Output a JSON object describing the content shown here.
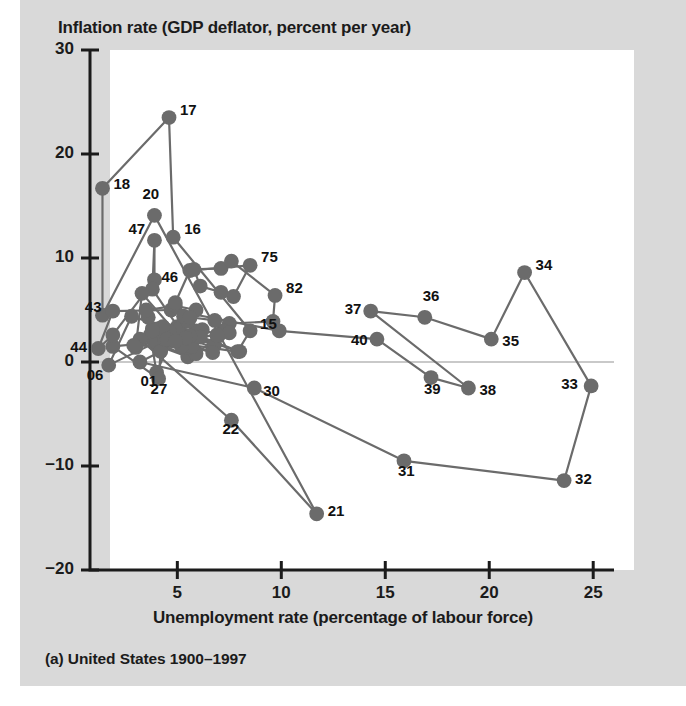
{
  "figure": {
    "caption": "(a) United States 1900–1997",
    "title": "Inflation rate (GDP deflator, percent per year)",
    "xaxis_title": "Unemployment rate (percentage of labour force)",
    "background_color": "#d9d9d9",
    "plot_background_color": "#ffffff",
    "marker_color": "#6b6b6b",
    "line_color": "#6b6b6b",
    "axis_color": "#1b1b1b"
  },
  "chart_data": {
    "type": "scatter",
    "title": "Inflation rate (GDP deflator, percent per year)",
    "subtitle": "(a) United States 1900–1997",
    "xlabel": "Unemployment rate (percentage of labour force)",
    "ylabel": "Inflation rate (GDP deflator, percent per year)",
    "xlim": [
      0.8,
      26.0
    ],
    "ylim": [
      -20,
      30
    ],
    "xticks": [
      5,
      10,
      15,
      20,
      25
    ],
    "yticks": [
      30,
      20,
      10,
      0,
      -10,
      -20
    ],
    "grid": false,
    "legend": null,
    "connected": true,
    "zero_line": true,
    "annotations": [
      "17",
      "18",
      "20",
      "47",
      "16",
      "36",
      "75",
      "82",
      "46",
      "43",
      "15",
      "44",
      "37",
      "36",
      "40",
      "34",
      "35",
      "39",
      "38",
      "33",
      "06",
      "01",
      "27",
      "36",
      "30",
      "22",
      "31",
      "32",
      "21"
    ],
    "series": [
      {
        "name": "United States 1900-1997",
        "points": [
          {
            "label": "00",
            "x": 5.0,
            "y": 3.4,
            "show_label": false
          },
          {
            "label": "01",
            "x": 4.0,
            "y": -1.0,
            "show_label": true,
            "lx": -16,
            "ly": 8
          },
          {
            "label": "02",
            "x": 3.7,
            "y": 2.6,
            "show_label": false
          },
          {
            "label": "03",
            "x": 3.9,
            "y": 1.8,
            "show_label": false
          },
          {
            "label": "04",
            "x": 5.4,
            "y": 1.2,
            "show_label": false
          },
          {
            "label": "05",
            "x": 4.3,
            "y": 2.2,
            "show_label": false
          },
          {
            "label": "06",
            "x": 1.7,
            "y": -0.3,
            "show_label": true,
            "lx": -22,
            "ly": 9
          },
          {
            "label": "07",
            "x": 2.8,
            "y": 4.4,
            "show_label": false
          },
          {
            "label": "08",
            "x": 8.0,
            "y": 1.0,
            "show_label": false
          },
          {
            "label": "09",
            "x": 5.1,
            "y": 3.2,
            "show_label": false
          },
          {
            "label": "10",
            "x": 5.9,
            "y": 3.0,
            "show_label": false
          },
          {
            "label": "11",
            "x": 6.7,
            "y": 1.4,
            "show_label": false
          },
          {
            "label": "12",
            "x": 4.6,
            "y": 3.0,
            "show_label": false
          },
          {
            "label": "13",
            "x": 4.3,
            "y": 2.0,
            "show_label": false
          },
          {
            "label": "14",
            "x": 7.9,
            "y": 1.0,
            "show_label": false
          },
          {
            "label": "15",
            "x": 8.5,
            "y": 3.0,
            "show_label": true,
            "lx": 10,
            "ly": -8
          },
          {
            "label": "16",
            "x": 4.8,
            "y": 12.0,
            "show_label": true,
            "lx": 11,
            "ly": -9
          },
          {
            "label": "17",
            "x": 4.6,
            "y": 23.5,
            "show_label": true,
            "lx": 11,
            "ly": -9
          },
          {
            "label": "18",
            "x": 1.4,
            "y": 16.7,
            "show_label": true,
            "lx": 11,
            "ly": -5
          },
          {
            "label": "19",
            "x": 1.4,
            "y": 4.5,
            "show_label": false
          },
          {
            "label": "20",
            "x": 3.9,
            "y": 14.1,
            "show_label": true,
            "lx": -12,
            "ly": -22
          },
          {
            "label": "21",
            "x": 11.7,
            "y": -14.6,
            "show_label": true,
            "lx": 11,
            "ly": -4
          },
          {
            "label": "22",
            "x": 7.6,
            "y": -5.6,
            "show_label": true,
            "lx": -9,
            "ly": 8
          },
          {
            "label": "23",
            "x": 3.2,
            "y": 2.2,
            "show_label": false
          },
          {
            "label": "24",
            "x": 5.5,
            "y": 0.5,
            "show_label": false
          },
          {
            "label": "25",
            "x": 4.0,
            "y": 1.9,
            "show_label": false
          },
          {
            "label": "26",
            "x": 1.9,
            "y": 1.5,
            "show_label": false
          },
          {
            "label": "27",
            "x": 4.1,
            "y": -1.6,
            "show_label": true,
            "lx": -8,
            "ly": 9
          },
          {
            "label": "28",
            "x": 4.2,
            "y": 1.0,
            "show_label": false
          },
          {
            "label": "29",
            "x": 3.2,
            "y": 0.0,
            "show_label": false
          },
          {
            "label": "30",
            "x": 8.7,
            "y": -2.5,
            "show_label": true,
            "lx": 9,
            "ly": 2
          },
          {
            "label": "31",
            "x": 15.9,
            "y": -9.5,
            "show_label": true,
            "lx": -6,
            "ly": 9
          },
          {
            "label": "32",
            "x": 23.6,
            "y": -11.4,
            "show_label": true,
            "lx": 11,
            "ly": -3
          },
          {
            "label": "33",
            "x": 24.9,
            "y": -2.3,
            "show_label": true,
            "lx": -30,
            "ly": -3
          },
          {
            "label": "34",
            "x": 21.7,
            "y": 8.6,
            "show_label": true,
            "lx": 11,
            "ly": -9
          },
          {
            "label": "35",
            "x": 20.1,
            "y": 2.2,
            "show_label": true,
            "lx": 11,
            "ly": 1
          },
          {
            "label": "36",
            "x": 16.9,
            "y": 4.3,
            "show_label": true,
            "lx": -2,
            "ly": -22
          },
          {
            "label": "37",
            "x": 14.3,
            "y": 4.9,
            "show_label": true,
            "lx": -26,
            "ly": -3
          },
          {
            "label": "38",
            "x": 19.0,
            "y": -2.5,
            "show_label": true,
            "lx": 11,
            "ly": 1
          },
          {
            "label": "39",
            "x": 17.2,
            "y": -1.5,
            "show_label": true,
            "lx": -7,
            "ly": 10
          },
          {
            "label": "40",
            "x": 14.6,
            "y": 2.2,
            "show_label": true,
            "lx": -26,
            "ly": 0
          },
          {
            "label": "41",
            "x": 9.9,
            "y": 3.0,
            "show_label": false
          },
          {
            "label": "42",
            "x": 4.7,
            "y": 5.0,
            "show_label": false
          },
          {
            "label": "43",
            "x": 1.9,
            "y": 4.9,
            "show_label": true,
            "lx": -28,
            "ly": -5
          },
          {
            "label": "44",
            "x": 1.2,
            "y": 1.3,
            "show_label": true,
            "lx": -28,
            "ly": -2
          },
          {
            "label": "45",
            "x": 1.9,
            "y": 2.6,
            "show_label": false
          },
          {
            "label": "46",
            "x": 3.9,
            "y": 7.9,
            "show_label": true,
            "lx": 7,
            "ly": -4
          },
          {
            "label": "47",
            "x": 3.9,
            "y": 11.7,
            "show_label": true,
            "lx": -26,
            "ly": -12
          },
          {
            "label": "48",
            "x": 3.8,
            "y": 7.0,
            "show_label": false
          },
          {
            "label": "49",
            "x": 5.9,
            "y": 0.8,
            "show_label": false
          },
          {
            "label": "50",
            "x": 5.3,
            "y": 2.0,
            "show_label": false
          },
          {
            "label": "51",
            "x": 3.3,
            "y": 6.6,
            "show_label": false
          },
          {
            "label": "52",
            "x": 3.0,
            "y": 1.4,
            "show_label": false
          },
          {
            "label": "53",
            "x": 2.9,
            "y": 1.6,
            "show_label": false
          },
          {
            "label": "54",
            "x": 5.5,
            "y": 1.4,
            "show_label": false
          },
          {
            "label": "55",
            "x": 4.4,
            "y": 2.2,
            "show_label": false
          },
          {
            "label": "56",
            "x": 4.1,
            "y": 3.2,
            "show_label": false
          },
          {
            "label": "57",
            "x": 4.3,
            "y": 3.4,
            "show_label": false
          },
          {
            "label": "58",
            "x": 6.8,
            "y": 1.7,
            "show_label": false
          },
          {
            "label": "59",
            "x": 5.5,
            "y": 2.4,
            "show_label": false
          },
          {
            "label": "60",
            "x": 5.5,
            "y": 1.6,
            "show_label": false
          },
          {
            "label": "61",
            "x": 6.7,
            "y": 0.9,
            "show_label": false
          },
          {
            "label": "62",
            "x": 5.5,
            "y": 1.8,
            "show_label": false
          },
          {
            "label": "63",
            "x": 5.7,
            "y": 1.5,
            "show_label": false
          },
          {
            "label": "64",
            "x": 5.2,
            "y": 1.5,
            "show_label": false
          },
          {
            "label": "65",
            "x": 4.5,
            "y": 2.2,
            "show_label": false
          },
          {
            "label": "66",
            "x": 3.8,
            "y": 3.2,
            "show_label": false
          },
          {
            "label": "67",
            "x": 3.8,
            "y": 3.0,
            "show_label": false
          },
          {
            "label": "68",
            "x": 3.6,
            "y": 4.3,
            "show_label": false
          },
          {
            "label": "69",
            "x": 3.5,
            "y": 5.0,
            "show_label": false
          },
          {
            "label": "70",
            "x": 4.9,
            "y": 5.4,
            "show_label": false
          },
          {
            "label": "71",
            "x": 5.9,
            "y": 5.0,
            "show_label": false
          },
          {
            "label": "72",
            "x": 5.6,
            "y": 4.2,
            "show_label": false
          },
          {
            "label": "73",
            "x": 4.9,
            "y": 5.7,
            "show_label": false
          },
          {
            "label": "74",
            "x": 5.6,
            "y": 8.8,
            "show_label": false
          },
          {
            "label": "75",
            "x": 8.5,
            "y": 9.3,
            "show_label": true,
            "lx": 11,
            "ly": -9
          },
          {
            "label": "76",
            "x": 7.7,
            "y": 6.3,
            "show_label": false
          },
          {
            "label": "77",
            "x": 7.1,
            "y": 6.7,
            "show_label": false
          },
          {
            "label": "78",
            "x": 6.1,
            "y": 7.3,
            "show_label": false
          },
          {
            "label": "79",
            "x": 5.8,
            "y": 8.9,
            "show_label": false
          },
          {
            "label": "80",
            "x": 7.1,
            "y": 9.0,
            "show_label": false
          },
          {
            "label": "81",
            "x": 7.6,
            "y": 9.7,
            "show_label": false
          },
          {
            "label": "82",
            "x": 9.7,
            "y": 6.4,
            "show_label": true,
            "lx": 11,
            "ly": -8
          },
          {
            "label": "83",
            "x": 9.6,
            "y": 3.9,
            "show_label": false
          },
          {
            "label": "84",
            "x": 7.5,
            "y": 3.7,
            "show_label": false
          },
          {
            "label": "85",
            "x": 7.2,
            "y": 3.0,
            "show_label": false
          },
          {
            "label": "86",
            "x": 7.0,
            "y": 2.6,
            "show_label": false
          },
          {
            "label": "87",
            "x": 6.2,
            "y": 3.1,
            "show_label": false
          },
          {
            "label": "88",
            "x": 5.5,
            "y": 3.9,
            "show_label": false
          },
          {
            "label": "89",
            "x": 5.3,
            "y": 4.4,
            "show_label": false
          },
          {
            "label": "90",
            "x": 5.6,
            "y": 4.3,
            "show_label": false
          },
          {
            "label": "91",
            "x": 6.8,
            "y": 4.0,
            "show_label": false
          },
          {
            "label": "92",
            "x": 7.5,
            "y": 2.8,
            "show_label": false
          },
          {
            "label": "93",
            "x": 6.9,
            "y": 2.6,
            "show_label": false
          },
          {
            "label": "94",
            "x": 6.1,
            "y": 2.4,
            "show_label": false
          },
          {
            "label": "95",
            "x": 5.6,
            "y": 2.5,
            "show_label": false
          },
          {
            "label": "96",
            "x": 5.4,
            "y": 2.3,
            "show_label": false
          },
          {
            "label": "97",
            "x": 4.9,
            "y": 2.0,
            "show_label": false
          }
        ]
      }
    ]
  },
  "axes": {
    "y_tick_labels": [
      "30",
      "20",
      "10",
      "0",
      "−10",
      "−20"
    ],
    "x_tick_labels": [
      "5",
      "10",
      "15",
      "20",
      "25"
    ]
  }
}
